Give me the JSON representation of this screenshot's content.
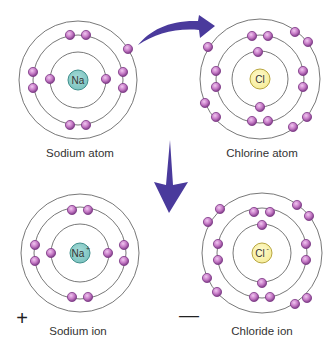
{
  "colors": {
    "background": "#ffffff",
    "orbit_stroke": "#555555",
    "electron_fill": "#c67ac6",
    "electron_stroke": "#7d3a86",
    "electron_highlight": "#f0c8f0",
    "sodium_nucleus_fill": "#7cc3c0",
    "sodium_nucleus_stroke": "#3f8f8c",
    "chlorine_nucleus_fill": "#f6ed9a",
    "chlorine_nucleus_stroke": "#b8a640",
    "arrow": "#4a3a9c"
  },
  "atoms": [
    {
      "id": "sodium-atom",
      "label": "Sodium atom",
      "symbol": "Na",
      "superscript": "",
      "nucleus_type": "sodium",
      "center": [
        78,
        80
      ],
      "orbits": [
        28,
        45,
        59
      ],
      "label_pos": [
        80,
        148
      ],
      "electrons": [
        [
          50,
          79
        ],
        [
          106,
          79
        ],
        [
          70,
          35
        ],
        [
          86,
          35
        ],
        [
          70,
          125
        ],
        [
          86,
          125
        ],
        [
          33,
          72
        ],
        [
          33,
          88
        ],
        [
          123,
          72
        ],
        [
          123,
          88
        ],
        [
          128,
          49
        ]
      ]
    },
    {
      "id": "chlorine-atom",
      "label": "Chlorine atom",
      "symbol": "Cl",
      "superscript": "",
      "nucleus_type": "chlorine",
      "center": [
        260,
        79
      ],
      "orbits": [
        28,
        44,
        60
      ],
      "label_pos": [
        262,
        148
      ],
      "electrons": [
        [
          258,
          52
        ],
        [
          260,
          107
        ],
        [
          252,
          36
        ],
        [
          268,
          36
        ],
        [
          216,
          71
        ],
        [
          216,
          87
        ],
        [
          303,
          71
        ],
        [
          303,
          87
        ],
        [
          252,
          121
        ],
        [
          268,
          121
        ],
        [
          208,
          47
        ],
        [
          295,
          32
        ],
        [
          308,
          42
        ],
        [
          205,
          103
        ],
        [
          216,
          117
        ],
        [
          293,
          127
        ],
        [
          307,
          117
        ]
      ]
    },
    {
      "id": "sodium-ion",
      "label": "Sodium ion",
      "symbol": "Na",
      "superscript": "+",
      "nucleus_type": "sodium",
      "center": [
        80,
        253
      ],
      "orbits": [
        29,
        46,
        59
      ],
      "label_pos": [
        78,
        326
      ],
      "charge": "+",
      "charge_pos": [
        22,
        318
      ],
      "electrons": [
        [
          51,
          253
        ],
        [
          108,
          253
        ],
        [
          72,
          210
        ],
        [
          88,
          210
        ],
        [
          72,
          297
        ],
        [
          88,
          297
        ],
        [
          35,
          245
        ],
        [
          35,
          261
        ],
        [
          124,
          245
        ],
        [
          124,
          261
        ]
      ]
    },
    {
      "id": "chloride-ion",
      "label": "Chloride ion",
      "symbol": "Cl",
      "superscript": "-",
      "nucleus_type": "chlorine",
      "center": [
        262,
        253
      ],
      "orbits": [
        29,
        45,
        60
      ],
      "label_pos": [
        262,
        326
      ],
      "charge": "—",
      "charge_pos": [
        189,
        315
      ],
      "electrons": [
        [
          262,
          225
        ],
        [
          262,
          283
        ],
        [
          254,
          212
        ],
        [
          270,
          212
        ],
        [
          218,
          244
        ],
        [
          218,
          260
        ],
        [
          306,
          244
        ],
        [
          306,
          260
        ],
        [
          254,
          297
        ],
        [
          270,
          297
        ],
        [
          220,
          209
        ],
        [
          208,
          222
        ],
        [
          297,
          205
        ],
        [
          309,
          216
        ],
        [
          207,
          278
        ],
        [
          217,
          292
        ],
        [
          295,
          304
        ],
        [
          307,
          298
        ]
      ]
    }
  ],
  "arrows": {
    "transfer": {
      "description": "curved arrow: electron transfer from sodium to chlorine"
    },
    "down": {
      "description": "down arrow: atoms become ions"
    }
  }
}
